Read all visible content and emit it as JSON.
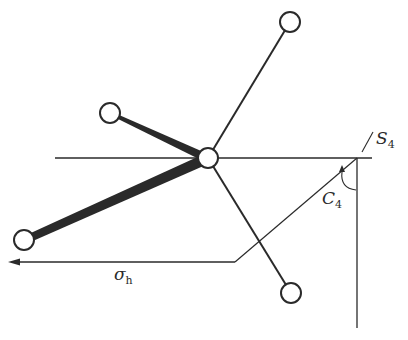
{
  "diagram": {
    "labels": {
      "s_main": "S",
      "s_sub": "4",
      "c_main": "C",
      "c_sub": "4",
      "sigma_main": "σ",
      "sigma_sub": "h"
    },
    "nodes": [
      {
        "id": "center",
        "x": 208,
        "y": 158
      },
      {
        "id": "top",
        "x": 290,
        "y": 22
      },
      {
        "id": "upper-left",
        "x": 110,
        "y": 113
      },
      {
        "id": "lower-left",
        "x": 24,
        "y": 240
      },
      {
        "id": "bottom",
        "x": 291,
        "y": 293
      }
    ],
    "colors": {
      "stroke": "#2a2a2a",
      "background": "#ffffff"
    }
  }
}
